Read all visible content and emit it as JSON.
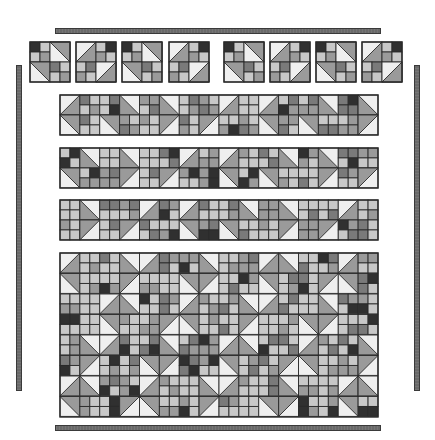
{
  "palette": {
    "white": "#efefef",
    "light": "#c8c8c8",
    "mid": "#9a9a9a",
    "dark": "#7a7a7a",
    "black": "#303030",
    "line": "#2a2a2a",
    "bar": "#6a6a6a"
  },
  "borders": {
    "top_bar": {
      "x": 55,
      "y": 28,
      "w": 326,
      "h": 6
    },
    "bottom_bar": {
      "x": 55,
      "y": 425,
      "w": 326,
      "h": 6
    },
    "left_bar": {
      "x": 16,
      "y": 65,
      "w": 6,
      "h": 326
    },
    "right_bar": {
      "x": 414,
      "y": 65,
      "w": 6,
      "h": 326
    }
  },
  "top_row_blocks": {
    "y": 42,
    "size": 40,
    "x_positions": [
      30,
      76,
      122,
      169,
      224,
      270,
      316,
      362
    ],
    "orientations": [
      "A",
      "B",
      "A",
      "B",
      "A",
      "B",
      "A",
      "B"
    ]
  },
  "strips": [
    {
      "name": "strip-1",
      "x": 60,
      "y": 95,
      "w": 318,
      "h": 40
    },
    {
      "name": "strip-2",
      "x": 60,
      "y": 148,
      "w": 318,
      "h": 40
    },
    {
      "name": "strip-3",
      "x": 60,
      "y": 200,
      "w": 318,
      "h": 40
    }
  ],
  "center_panel": {
    "x": 60,
    "y": 253,
    "w": 318,
    "h": 164
  }
}
